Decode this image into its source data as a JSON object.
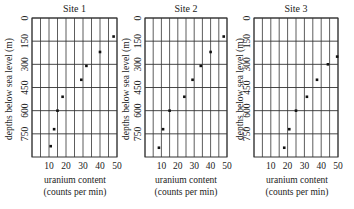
{
  "chart_data": [
    {
      "type": "scatter",
      "title": "Site 1",
      "xlabel": "uranium content (counts per min)",
      "ylabel": "depths below sea level (m)",
      "x_ticks": [
        10,
        20,
        30,
        40,
        50
      ],
      "y_ticks": [
        0,
        150,
        300,
        450,
        600,
        750
      ],
      "xlim": [
        0,
        50
      ],
      "ylim": [
        0,
        900
      ],
      "y_inverted": true,
      "grid": true,
      "points": [
        {
          "x": 48,
          "y": 120
        },
        {
          "x": 40,
          "y": 220
        },
        {
          "x": 32,
          "y": 310
        },
        {
          "x": 29,
          "y": 400
        },
        {
          "x": 18,
          "y": 510
        },
        {
          "x": 15,
          "y": 600
        },
        {
          "x": 13,
          "y": 720
        },
        {
          "x": 11,
          "y": 830
        }
      ]
    },
    {
      "type": "scatter",
      "title": "Site 2",
      "xlabel": "uranium content (counts per min)",
      "ylabel": "depths below sea level (m)",
      "x_ticks": [
        10,
        20,
        30,
        40,
        50
      ],
      "y_ticks": [
        0,
        150,
        300,
        450,
        600,
        750
      ],
      "xlim": [
        0,
        50
      ],
      "ylim": [
        0,
        900
      ],
      "y_inverted": true,
      "grid": true,
      "points": [
        {
          "x": 48,
          "y": 120
        },
        {
          "x": 40,
          "y": 220
        },
        {
          "x": 34,
          "y": 310
        },
        {
          "x": 29,
          "y": 400
        },
        {
          "x": 24,
          "y": 510
        },
        {
          "x": 15,
          "y": 600
        },
        {
          "x": 11,
          "y": 720
        },
        {
          "x": 8.5,
          "y": 840
        }
      ]
    },
    {
      "type": "scatter",
      "title": "Site 3",
      "xlabel": "uranium content (counts per min)",
      "ylabel": "depths below sea level (m)",
      "x_ticks": [
        10,
        20,
        30,
        40,
        50
      ],
      "y_ticks": [
        0,
        150,
        300,
        450,
        600,
        750
      ],
      "xlim": [
        0,
        50
      ],
      "ylim": [
        0,
        900
      ],
      "y_inverted": true,
      "grid": true,
      "points": [
        {
          "x": 49.5,
          "y": 250
        },
        {
          "x": 44,
          "y": 300
        },
        {
          "x": 37.5,
          "y": 400
        },
        {
          "x": 31.5,
          "y": 510
        },
        {
          "x": 25,
          "y": 600
        },
        {
          "x": 21,
          "y": 720
        },
        {
          "x": 18,
          "y": 840
        }
      ]
    }
  ],
  "panels": [
    {
      "title": "Site 1",
      "xlabel_line1": "uranium content",
      "xlabel_line2": "(counts per min)",
      "ylabel": "depths below sea level (m)"
    },
    {
      "title": "Site 2",
      "xlabel_line1": "uranium content",
      "xlabel_line2": "(counts per min)",
      "ylabel": "depths below sea level (m)"
    },
    {
      "title": "Site 3",
      "xlabel_line1": "uranium content",
      "xlabel_line2": "(counts per min)",
      "ylabel": "depths below sea level (m)"
    }
  ],
  "colors": {
    "grid": "#333333",
    "point": "#111111",
    "text": "#222222"
  }
}
